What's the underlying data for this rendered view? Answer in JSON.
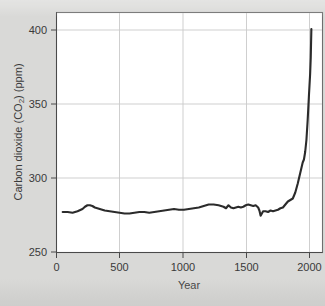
{
  "figure": {
    "background_color": "#d9d9d7",
    "plot_background_color": "#ffffff",
    "line_color": "#2b2b2b",
    "grid_color": "#c9c9c9",
    "axis_color": "#4a4a4a"
  },
  "chart_data": {
    "type": "line",
    "title": "",
    "subtitle": "",
    "xlabel": "Year",
    "ylabel": "Carbon dioxide (CO₂) (ppm)",
    "ylabel_parts": {
      "prefix": "Carbon dioxide (CO",
      "subscript": "2",
      "suffix": ") (ppm)"
    },
    "xlim": [
      -50,
      2100
    ],
    "ylim": [
      250,
      410
    ],
    "xticks": [
      0,
      500,
      1000,
      1500,
      2000
    ],
    "xtick_labels": [
      "0",
      "500",
      "1000",
      "1500",
      "2000"
    ],
    "yticks": [
      250,
      300,
      350,
      400
    ],
    "ytick_labels": [
      "250",
      "300",
      "350",
      "400"
    ],
    "grid": true,
    "grid_axis": "both",
    "legend": false,
    "legend_position": "none",
    "series": [
      {
        "name": "Atmospheric CO2 concentration",
        "x": [
          0,
          40,
          80,
          120,
          160,
          180,
          200,
          220,
          240,
          260,
          300,
          340,
          380,
          420,
          460,
          500,
          540,
          580,
          620,
          660,
          700,
          740,
          780,
          820,
          860,
          900,
          940,
          980,
          1020,
          1060,
          1100,
          1140,
          1180,
          1220,
          1260,
          1300,
          1320,
          1340,
          1360,
          1380,
          1400,
          1420,
          1440,
          1460,
          1480,
          1500,
          1520,
          1540,
          1560,
          1580,
          1590,
          1600,
          1610,
          1620,
          1640,
          1660,
          1680,
          1700,
          1720,
          1740,
          1760,
          1780,
          1800,
          1820,
          1840,
          1860,
          1880,
          1900,
          1920,
          1940,
          1950,
          1960,
          1970,
          1980,
          1990,
          2000,
          2005,
          2010
        ],
        "y": [
          277,
          277,
          276.5,
          277.5,
          279,
          280.5,
          281.5,
          281.5,
          281,
          280,
          279,
          278,
          277.5,
          277,
          276.5,
          276,
          276,
          276.5,
          277,
          277,
          276.5,
          277,
          277.5,
          278,
          278.5,
          279,
          278.5,
          278.5,
          279,
          279.5,
          280,
          281,
          282,
          282,
          281.5,
          280.5,
          279.5,
          281.5,
          280,
          279.5,
          280,
          280.5,
          280,
          280.5,
          281.5,
          282,
          281.5,
          281,
          281.5,
          280,
          278,
          274.5,
          276,
          277.5,
          277.5,
          277,
          278,
          277.5,
          278,
          278.5,
          279.5,
          280,
          282,
          284,
          285,
          286,
          290,
          296,
          303,
          310,
          312,
          317,
          325,
          338,
          354,
          369,
          380,
          399
        ]
      }
    ],
    "annotations": []
  }
}
